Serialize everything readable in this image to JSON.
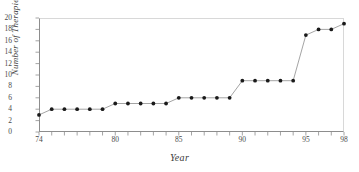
{
  "chart_data": {
    "type": "line",
    "title": "",
    "xlabel": "Year",
    "ylabel": "Number of Therapies",
    "x": [
      74,
      75,
      76,
      77,
      78,
      79,
      80,
      81,
      82,
      83,
      84,
      85,
      86,
      87,
      88,
      89,
      90,
      91,
      92,
      93,
      94,
      95,
      96,
      97,
      98
    ],
    "values": [
      3,
      4,
      4,
      4,
      4,
      4,
      5,
      5,
      5,
      5,
      5,
      6,
      6,
      6,
      6,
      6,
      9,
      9,
      9,
      9,
      9,
      17,
      18,
      18,
      19
    ],
    "series": [
      {
        "name": "Number of Therapies",
        "values": [
          3,
          4,
          4,
          4,
          4,
          4,
          5,
          5,
          5,
          5,
          5,
          6,
          6,
          6,
          6,
          6,
          9,
          9,
          9,
          9,
          9,
          17,
          18,
          18,
          19
        ]
      }
    ],
    "xlim": [
      74,
      98
    ],
    "ylim": [
      0,
      20
    ],
    "ytick_values": [
      0,
      2,
      4,
      6,
      8,
      10,
      12,
      14,
      16,
      18,
      20
    ],
    "ytick_labels": [
      "0",
      "2",
      "4",
      "6",
      "8",
      "10",
      "12",
      "14",
      "16",
      "18",
      "20"
    ],
    "xtick_values": [
      74,
      80,
      85,
      90,
      95,
      98
    ],
    "xtick_labels": [
      "74",
      "80",
      "85",
      "90",
      "95",
      "98"
    ],
    "xminor_step": 1,
    "grid": false,
    "legend": "none",
    "marker": "filled-circle",
    "marker_color": "#1a1a1a",
    "line_color": "#9a9a9a",
    "axis_color": "#8d8d8d",
    "frame_color": "#d8d8d8",
    "background": "#ffffff"
  }
}
